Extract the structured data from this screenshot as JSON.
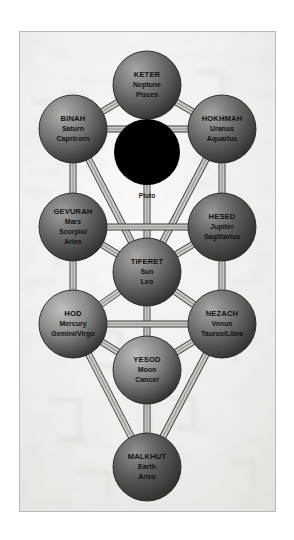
{
  "figure": {
    "frame_color": "#b9b9b9",
    "background_color": "#f2f2f0",
    "path_fill": "#c9c9c4",
    "path_stroke": "#3a3a38"
  },
  "daat": {
    "label": "DA'AT",
    "sub": "Pluto",
    "color": "#000000",
    "cx": 127,
    "cy": 120,
    "r": 33
  },
  "sephirot": [
    {
      "id": "keter",
      "name": "KETER",
      "planet": "Neptune",
      "sign": "Pisces",
      "cx": 127,
      "cy": 53,
      "r": 34,
      "color": "#6f6f6f",
      "highlight": "#a8a8a8"
    },
    {
      "id": "binah",
      "name": "BINAH",
      "planet": "Saturn",
      "sign": "Capricorn",
      "cx": 53,
      "cy": 97,
      "r": 34,
      "color": "#777777",
      "highlight": "#b0b0b0"
    },
    {
      "id": "hokhmah",
      "name": "HOKHMAH",
      "planet": "Uranus",
      "sign": "Aquarius",
      "cx": 202,
      "cy": 97,
      "r": 34,
      "color": "#6b6b6b",
      "highlight": "#a4a4a4"
    },
    {
      "id": "gevurah",
      "name": "GEVURAH",
      "planet": "Mars",
      "sign": "Scorpio/",
      "sign2": "Aries",
      "cx": 53,
      "cy": 195,
      "r": 34,
      "color": "#686868",
      "highlight": "#a0a0a0"
    },
    {
      "id": "hesed",
      "name": "HESED",
      "planet": "Jupiter",
      "sign": "Sagittarius",
      "cx": 202,
      "cy": 195,
      "r": 34,
      "color": "#5d5d5d",
      "highlight": "#989898"
    },
    {
      "id": "tiferet",
      "name": "TIFERET",
      "planet": "Sun",
      "sign": "Leo",
      "cx": 127,
      "cy": 240,
      "r": 34,
      "color": "#707070",
      "highlight": "#a8a8a8"
    },
    {
      "id": "hod",
      "name": "HOD",
      "planet": "Mercury",
      "sign": "Gemini/Virgo",
      "cx": 53,
      "cy": 292,
      "r": 34,
      "color": "#8a8a8a",
      "highlight": "#c0c0c0"
    },
    {
      "id": "nezach",
      "name": "NEZACH",
      "planet": "Venus",
      "sign": "Taurus/Libra",
      "cx": 202,
      "cy": 292,
      "r": 34,
      "color": "#6e6e6e",
      "highlight": "#a6a6a6"
    },
    {
      "id": "yesod",
      "name": "YESOD",
      "planet": "Moon",
      "sign": "Cancer",
      "cx": 127,
      "cy": 338,
      "r": 34,
      "color": "#858585",
      "highlight": "#bcbcbc"
    },
    {
      "id": "malkhut",
      "name": "MALKHUT",
      "planet": "Earth",
      "sign": "Aries",
      "cx": 127,
      "cy": 435,
      "r": 34,
      "color": "#5a5a5a",
      "highlight": "#929292"
    }
  ],
  "paths": [
    {
      "from": "keter",
      "to": "binah"
    },
    {
      "from": "keter",
      "to": "hokhmah"
    },
    {
      "from": "keter",
      "to": "tiferet"
    },
    {
      "from": "binah",
      "to": "hokhmah"
    },
    {
      "from": "binah",
      "to": "gevurah"
    },
    {
      "from": "binah",
      "to": "tiferet"
    },
    {
      "from": "hokhmah",
      "to": "hesed"
    },
    {
      "from": "hokhmah",
      "to": "tiferet"
    },
    {
      "from": "gevurah",
      "to": "hesed"
    },
    {
      "from": "gevurah",
      "to": "tiferet"
    },
    {
      "from": "gevurah",
      "to": "hod"
    },
    {
      "from": "hesed",
      "to": "tiferet"
    },
    {
      "from": "hesed",
      "to": "nezach"
    },
    {
      "from": "tiferet",
      "to": "hod"
    },
    {
      "from": "tiferet",
      "to": "nezach"
    },
    {
      "from": "tiferet",
      "to": "yesod"
    },
    {
      "from": "hod",
      "to": "nezach"
    },
    {
      "from": "hod",
      "to": "yesod"
    },
    {
      "from": "hod",
      "to": "malkhut"
    },
    {
      "from": "nezach",
      "to": "yesod"
    },
    {
      "from": "nezach",
      "to": "malkhut"
    },
    {
      "from": "yesod",
      "to": "malkhut"
    }
  ]
}
